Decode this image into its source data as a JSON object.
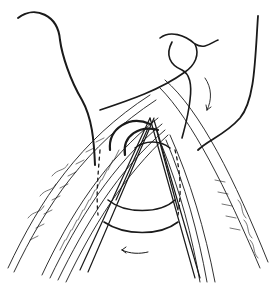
{
  "figure": {
    "kind": "surgical suture line illustration",
    "width": 274,
    "height": 288,
    "colors": {
      "ink": "#1a1a1a",
      "background": "#ffffff"
    }
  }
}
